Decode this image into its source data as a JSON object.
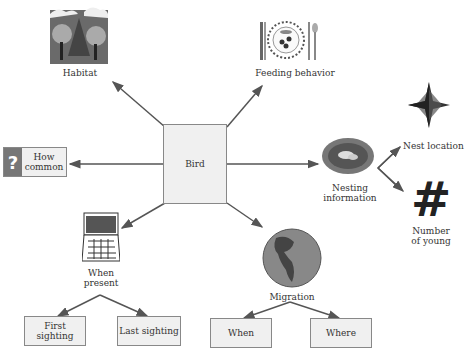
{
  "diagram": {
    "central": {
      "label": "Bird"
    },
    "nodes": [
      {
        "id": "habitat",
        "label": "Habitat",
        "icon": "forest-icon"
      },
      {
        "id": "feeding",
        "label": "Feeding behavior",
        "icon": "place-setting-icon"
      },
      {
        "id": "how-common",
        "label": "How common",
        "label_line1": "How",
        "label_line2": "common",
        "icon": "question-mark-icon"
      },
      {
        "id": "nesting",
        "label": "Nesting information",
        "label_line1": "Nesting",
        "label_line2": "information",
        "icon": "nest-icon"
      },
      {
        "id": "when-present",
        "label": "When present",
        "label_line1": "When",
        "label_line2": "present",
        "icon": "calendar-icon"
      },
      {
        "id": "migration",
        "label": "Migration",
        "icon": "globe-icon"
      },
      {
        "id": "nest-location",
        "label": "Nest location",
        "icon": "compass-star-icon"
      },
      {
        "id": "number-of-young",
        "label": "Number of young",
        "label_line1": "Number",
        "label_line2": "of young",
        "icon": "hash-icon"
      },
      {
        "id": "first-sighting",
        "label": "First sighting"
      },
      {
        "id": "last-sighting",
        "label": "Last sighting"
      },
      {
        "id": "migration-when",
        "label": "When"
      },
      {
        "id": "migration-where",
        "label": "Where"
      }
    ],
    "edges": [
      [
        "Bird",
        "Habitat"
      ],
      [
        "Bird",
        "Feeding behavior"
      ],
      [
        "Bird",
        "How common"
      ],
      [
        "Bird",
        "Nesting information"
      ],
      [
        "Bird",
        "When present"
      ],
      [
        "Bird",
        "Migration"
      ],
      [
        "Nesting information",
        "Nest location"
      ],
      [
        "Nesting information",
        "Number of young"
      ],
      [
        "When present",
        "First sighting"
      ],
      [
        "When present",
        "Last sighting"
      ],
      [
        "Migration",
        "When"
      ],
      [
        "Migration",
        "Where"
      ]
    ],
    "colors": {
      "line": "#555555",
      "box_fill": "#f0f0f0",
      "box_border": "#888888",
      "question_bg": "#777777"
    }
  }
}
